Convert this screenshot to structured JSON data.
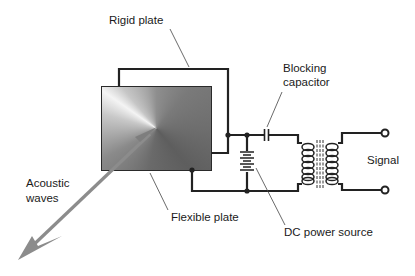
{
  "diagram": {
    "labels": {
      "rigid_plate": "Rigid plate",
      "blocking_capacitor_line1": "Blocking",
      "blocking_capacitor_line2": "capacitor",
      "signal": "Signal",
      "acoustic_waves_line1": "Acoustic",
      "acoustic_waves_line2": "waves",
      "flexible_plate": "Flexible plate",
      "dc_power_source": "DC power source"
    },
    "components": [
      "rigid-plate",
      "flexible-plate",
      "blocking-capacitor",
      "dc-power-source",
      "transformer",
      "signal-terminals",
      "acoustic-wave-arrow"
    ],
    "colors": {
      "wire": "#222222",
      "arrow": "#8a8a8a",
      "leader": "#444444",
      "text": "#1a1a1a"
    }
  }
}
